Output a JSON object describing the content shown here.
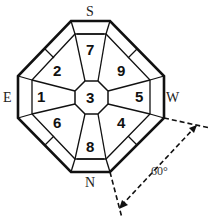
{
  "diagram": {
    "compass": {
      "top": "S",
      "left": "E",
      "right": "W",
      "bottom": "N"
    },
    "sectors": {
      "center": "3",
      "top": "7",
      "top_left": "2",
      "top_right": "9",
      "left": "1",
      "right": "5",
      "bottom_left": "6",
      "bottom_right": "4",
      "bottom": "8"
    },
    "angle_label": "60°",
    "colors": {
      "line": "#111111",
      "background": "#ffffff"
    }
  }
}
